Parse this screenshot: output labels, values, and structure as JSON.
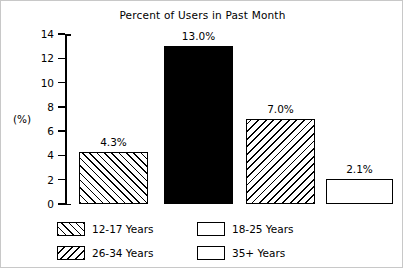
{
  "chart_data": {
    "type": "bar",
    "title": "Percent of Users in Past Month",
    "xlabel": "",
    "ylabel": "(%)",
    "ylim": [
      0,
      14
    ],
    "yticks": [
      "0",
      "2",
      "4",
      "6",
      "8",
      "10",
      "12",
      "14"
    ],
    "grid": false,
    "legend_position": "bottom",
    "categories": [
      "12-17 Years",
      "18-25 Years",
      "26-34 Years",
      "35+ Years"
    ],
    "values": [
      4.3,
      13.0,
      7.0,
      2.1
    ],
    "data_labels": [
      "4.3%",
      "13.0%",
      "7.0%",
      "2.1%"
    ],
    "fills": [
      "hatch-forward",
      "solid-black",
      "hatch-backward",
      "white-empty"
    ],
    "colors": {
      "bar_outline": "#000000",
      "bar_solid": "#000000",
      "bar_empty": "#ffffff",
      "background": "#ffffff",
      "axis": "#000000"
    }
  },
  "legend": {
    "entries": [
      {
        "label": "12-17 Years",
        "fill": "hatch-forward"
      },
      {
        "label": "18-25 Years",
        "fill": "solid-black"
      },
      {
        "label": "26-34 Years",
        "fill": "hatch-backward"
      },
      {
        "label": "35+ Years",
        "fill": "white-empty"
      }
    ]
  }
}
